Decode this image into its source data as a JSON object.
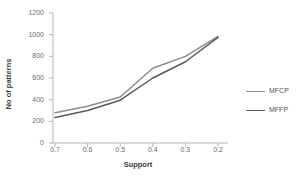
{
  "chart_data": {
    "type": "line",
    "title": "",
    "xlabel": "Support",
    "ylabel": "No of patterns",
    "categories": [
      "0.7",
      "0.6",
      "0.5",
      "0.4",
      "0.3",
      "0.2"
    ],
    "x": [
      0.7,
      0.6,
      0.5,
      0.4,
      0.3,
      0.2
    ],
    "xlim": [
      0.7,
      0.2
    ],
    "ylim": [
      0,
      1200
    ],
    "yticks": [
      0,
      200,
      400,
      600,
      800,
      1000,
      1200
    ],
    "ytick_labels": [
      "0",
      "200",
      "400",
      "600",
      "800",
      "1000",
      "1200"
    ],
    "grid": false,
    "legend_position": "right",
    "series": [
      {
        "name": "MFCP",
        "color": "#8c8c8c",
        "values": [
          280,
          340,
          425,
          690,
          800,
          985
        ]
      },
      {
        "name": "MFFP",
        "color": "#5a5a5a",
        "values": [
          235,
          300,
          395,
          600,
          750,
          975
        ]
      }
    ]
  },
  "axes": {
    "axis_color": "#b5b5b5",
    "tick_color": "#6b6b6b"
  },
  "legend": {
    "entries": [
      {
        "label": "MFCP",
        "color": "#8c8c8c"
      },
      {
        "label": "MFFP",
        "color": "#5a5a5a"
      }
    ]
  }
}
